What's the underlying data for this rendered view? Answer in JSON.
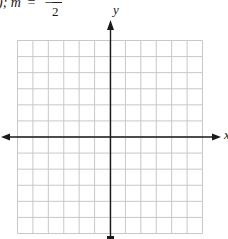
{
  "header": {
    "prefix": ");",
    "variable": "m",
    "equals": "=",
    "sign": "−",
    "denominator": "2"
  },
  "axes": {
    "x_label": "x",
    "y_label": "y"
  },
  "grid": {
    "columns": 12,
    "rows": 12,
    "origin_column": 6,
    "origin_row": 6,
    "line_color": "#c8c8c8",
    "axis_color": "#1a1a1a"
  }
}
